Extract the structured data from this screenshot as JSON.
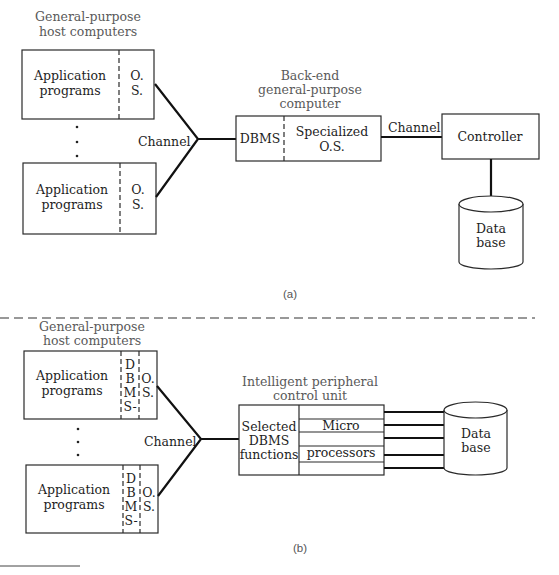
{
  "figure_a": {
    "hosts_caption_line1": "General-purpose",
    "hosts_caption_line2": "host computers",
    "host_top": {
      "app_line1": "Application",
      "app_line2": "programs",
      "os_line1": "O.",
      "os_line2": "S."
    },
    "host_bottom": {
      "app_line1": "Application",
      "app_line2": "programs",
      "os_line1": "O.",
      "os_line2": "S."
    },
    "ellipsis": "⋮",
    "channel_label": "Channel",
    "backend_caption_line1": "Back-end",
    "backend_caption_line2": "general-purpose",
    "backend_caption_line3": "computer",
    "backend_dbms": "DBMS",
    "backend_os_line1": "Specialized",
    "backend_os_line2": "O.S.",
    "channel2_label": "Channel",
    "controller_label": "Controller",
    "database_line1": "Data",
    "database_line2": "base",
    "sublabel": "(a)"
  },
  "figure_b": {
    "hosts_caption_line1": "General-purpose",
    "hosts_caption_line2": "host computers",
    "host_top": {
      "app_line1": "Application",
      "app_line2": "programs",
      "dbms_letters": [
        "D",
        "B",
        "M",
        "S-"
      ],
      "os_line1": "O.",
      "os_line2": "S."
    },
    "host_bottom": {
      "app_line1": "Application",
      "app_line2": "programs",
      "dbms_letters": [
        "D",
        "B",
        "M",
        "S-"
      ],
      "os_line1": "O.",
      "os_line2": "S."
    },
    "channel_label": "Channel",
    "unit_caption_line1": "Intelligent peripheral",
    "unit_caption_line2": "control unit",
    "selected_line1": "Selected",
    "selected_line2": "DBMS",
    "selected_line3": "functions",
    "micro_label": "Micro",
    "processors_label": "processors",
    "database_line1": "Data",
    "database_line2": "base",
    "sublabel": "(b)"
  }
}
